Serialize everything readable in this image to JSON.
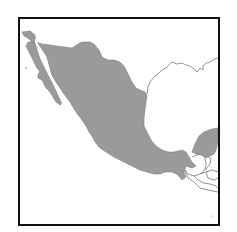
{
  "map": {
    "title": "Mexico",
    "highlighted_region": "Mexico",
    "colors": {
      "highlight_fill": "#9a9a9a",
      "highlight_stroke": "#7d7d7d",
      "border_line": "#888888",
      "background": "#ffffff",
      "frame": "#111111"
    },
    "regions": [
      {
        "name": "Mexico",
        "style": "filled"
      },
      {
        "name": "United States",
        "style": "outline"
      },
      {
        "name": "Guatemala",
        "style": "outline"
      },
      {
        "name": "Belize",
        "style": "outline"
      },
      {
        "name": "Honduras",
        "style": "outline"
      },
      {
        "name": "El Salvador",
        "style": "outline"
      }
    ]
  }
}
